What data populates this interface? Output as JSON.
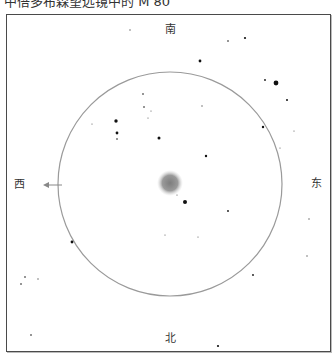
{
  "title": "中倍多布森望远镜中的 M 80",
  "directions": {
    "north": "北",
    "south": "南",
    "east": "东",
    "west": "西"
  },
  "field_circle": {
    "cx": 170,
    "cy": 184,
    "r": 112,
    "color": "#9a9a9a"
  },
  "cluster": {
    "name": "M 80",
    "cx": 170,
    "cy": 183,
    "r": 11,
    "color": "#8c8c8c"
  },
  "arrow": {
    "direction": "west",
    "x1": 62,
    "x2": 43,
    "y": 185,
    "color": "#888888"
  },
  "stars": [
    {
      "x": 130,
      "y": 30,
      "r": 0.7
    },
    {
      "x": 228,
      "y": 41,
      "r": 0.8
    },
    {
      "x": 245,
      "y": 38,
      "r": 1.1
    },
    {
      "x": 200,
      "y": 61,
      "r": 1.4
    },
    {
      "x": 265,
      "y": 80,
      "r": 0.9
    },
    {
      "x": 276,
      "y": 83,
      "r": 2.4
    },
    {
      "x": 287,
      "y": 100,
      "r": 1.0
    },
    {
      "x": 143,
      "y": 94,
      "r": 0.8
    },
    {
      "x": 144,
      "y": 107,
      "r": 0.8
    },
    {
      "x": 151,
      "y": 111,
      "r": 0.6
    },
    {
      "x": 148,
      "y": 118,
      "r": 0.6
    },
    {
      "x": 116,
      "y": 121,
      "r": 1.7
    },
    {
      "x": 92,
      "y": 124,
      "r": 0.5
    },
    {
      "x": 117,
      "y": 133,
      "r": 1.4
    },
    {
      "x": 117,
      "y": 139,
      "r": 0.8
    },
    {
      "x": 159,
      "y": 138,
      "r": 1.5
    },
    {
      "x": 202,
      "y": 106,
      "r": 0.7
    },
    {
      "x": 263,
      "y": 127,
      "r": 1.2
    },
    {
      "x": 294,
      "y": 131,
      "r": 0.5
    },
    {
      "x": 280,
      "y": 148,
      "r": 0.6
    },
    {
      "x": 206,
      "y": 156,
      "r": 1.2
    },
    {
      "x": 177,
      "y": 195,
      "r": 0.5
    },
    {
      "x": 185,
      "y": 202,
      "r": 2.0
    },
    {
      "x": 228,
      "y": 211,
      "r": 0.9
    },
    {
      "x": 309,
      "y": 219,
      "r": 0.7
    },
    {
      "x": 165,
      "y": 235,
      "r": 0.6
    },
    {
      "x": 198,
      "y": 237,
      "r": 0.6
    },
    {
      "x": 72,
      "y": 242,
      "r": 1.4
    },
    {
      "x": 307,
      "y": 256,
      "r": 0.7
    },
    {
      "x": 253,
      "y": 275,
      "r": 0.9
    },
    {
      "x": 25,
      "y": 277,
      "r": 0.8
    },
    {
      "x": 38,
      "y": 279,
      "r": 0.7
    },
    {
      "x": 21,
      "y": 284,
      "r": 0.8
    },
    {
      "x": 31,
      "y": 335,
      "r": 0.8
    },
    {
      "x": 218,
      "y": 346,
      "r": 1.1
    }
  ]
}
